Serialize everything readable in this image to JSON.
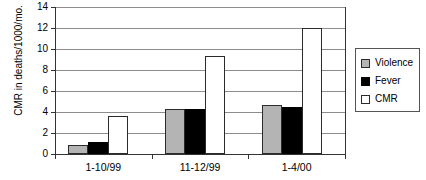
{
  "chart_data": {
    "type": "bar",
    "title": "",
    "xlabel": "",
    "ylabel": "CMR in deaths/1000/mo.",
    "ylim": [
      0,
      14
    ],
    "ytick_step": 2,
    "yticks": [
      0,
      2,
      4,
      6,
      8,
      10,
      12,
      14
    ],
    "ytick_labels": [
      "0",
      "2",
      "4",
      "6",
      "8",
      "10",
      "12",
      "14"
    ],
    "grid": true,
    "grid_axis": "y",
    "legend_position": "right",
    "categories": [
      "1-10/99",
      "11-12/99",
      "1-4/00"
    ],
    "series": [
      {
        "name": "Violence",
        "color": "#b4b4b4",
        "values": [
          0.9,
          4.3,
          4.7
        ]
      },
      {
        "name": "Fever",
        "color": "#000000",
        "values": [
          1.1,
          4.3,
          4.5
        ]
      },
      {
        "name": "CMR",
        "color": "#ffffff",
        "values": [
          3.6,
          9.3,
          12.0
        ]
      }
    ]
  },
  "legend": {
    "items": [
      {
        "label": "Violence",
        "swatch": "violence"
      },
      {
        "label": "Fever",
        "swatch": "fever"
      },
      {
        "label": "CMR",
        "swatch": "cmr"
      }
    ]
  }
}
